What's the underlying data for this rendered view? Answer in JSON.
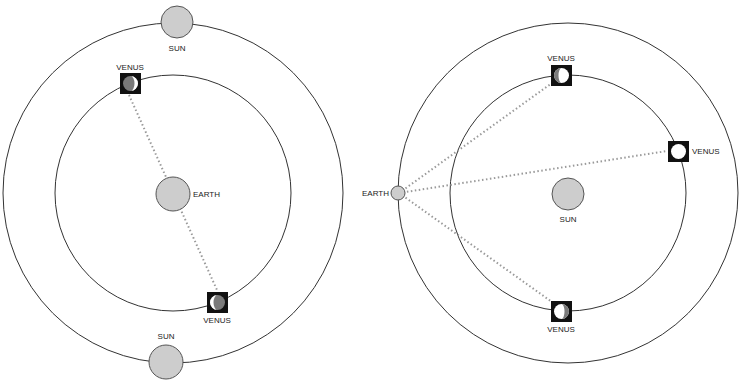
{
  "diagrams": [
    {
      "name": "geocentric-model",
      "center_body": "EARTH",
      "orbiting_bodies": [
        {
          "label": "SUN",
          "position": "top"
        },
        {
          "label": "SUN",
          "position": "bottom"
        },
        {
          "label": "VENUS",
          "position": "upper-left",
          "phase": "crescent"
        },
        {
          "label": "VENUS",
          "position": "lower-right",
          "phase": "crescent"
        }
      ],
      "labels": {
        "earth": "EARTH",
        "sun_top": "SUN",
        "sun_bottom": "SUN",
        "venus_top": "VENUS",
        "venus_bottom": "VENUS"
      }
    },
    {
      "name": "heliocentric-model",
      "center_body": "SUN",
      "orbiting_bodies": [
        {
          "label": "EARTH",
          "position": "left"
        },
        {
          "label": "VENUS",
          "position": "top",
          "phase": "gibbous"
        },
        {
          "label": "VENUS",
          "position": "right",
          "phase": "full"
        },
        {
          "label": "VENUS",
          "position": "bottom",
          "phase": "gibbous"
        }
      ],
      "labels": {
        "earth": "EARTH",
        "sun": "SUN",
        "venus_top": "VENUS",
        "venus_right": "VENUS",
        "venus_bottom": "VENUS"
      }
    }
  ],
  "colors": {
    "orbit": "#333333",
    "body_fill": "#cdcdcd",
    "sight_line": "#9a9a9a",
    "venus_box": "#111111"
  }
}
